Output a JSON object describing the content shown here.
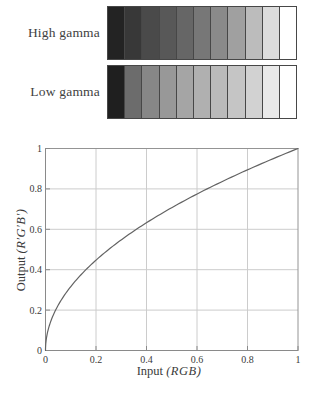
{
  "strips": {
    "segment_count": 11,
    "border_color": "#474747",
    "rows": [
      {
        "label": "High gamma",
        "colors": [
          "#232323",
          "#383838",
          "#4a4a4a",
          "#585858",
          "#666666",
          "#777777",
          "#8a8a8a",
          "#a0a0a0",
          "#bcbcbc",
          "#dcdcdc",
          "#ffffff"
        ]
      },
      {
        "label": "Low gamma",
        "colors": [
          "#1f1f1f",
          "#6c6c6c",
          "#878787",
          "#989898",
          "#a5a5a5",
          "#b0b0b0",
          "#bababa",
          "#c5c5c5",
          "#d2d2d2",
          "#e9e9e9",
          "#ffffff"
        ]
      }
    ]
  },
  "chart_data": {
    "type": "line",
    "title": "",
    "xlabel": "Input (RGB)",
    "xlabel_parts": {
      "roman": "Input",
      "italic": "(RGB)"
    },
    "ylabel": "Output (R′G′B′)",
    "ylabel_parts": {
      "roman": "Output",
      "italic": "(R′G′B′)"
    },
    "xlim": [
      0,
      1
    ],
    "ylim": [
      0,
      1
    ],
    "grid": true,
    "legend": "none",
    "x_ticks": {
      "values": [
        0,
        0.2,
        0.4,
        0.6,
        0.8,
        1
      ],
      "labels": [
        "0",
        "0.2",
        "0.4",
        "0.6",
        "0.8",
        "1"
      ]
    },
    "y_ticks": {
      "values": [
        0,
        0.2,
        0.4,
        0.6,
        0.8,
        1
      ],
      "labels": [
        "0",
        "0.2",
        "0.4",
        "0.6",
        "0.8",
        "1"
      ]
    },
    "series": [
      {
        "name": "gamma correction curve",
        "function": "output = input^0.5",
        "exponent": 0.5,
        "points": [
          [
            0,
            0
          ],
          [
            0.05,
            0.224
          ],
          [
            0.1,
            0.316
          ],
          [
            0.15,
            0.387
          ],
          [
            0.2,
            0.447
          ],
          [
            0.3,
            0.548
          ],
          [
            0.4,
            0.632
          ],
          [
            0.5,
            0.707
          ],
          [
            0.6,
            0.775
          ],
          [
            0.7,
            0.837
          ],
          [
            0.8,
            0.894
          ],
          [
            0.9,
            0.949
          ],
          [
            1,
            1
          ]
        ]
      }
    ],
    "colors": {
      "grid": "#cccccc",
      "box": "#949494",
      "axis": "#8a8a8a",
      "curve": "#636363",
      "text": "#3a3a3a"
    }
  }
}
